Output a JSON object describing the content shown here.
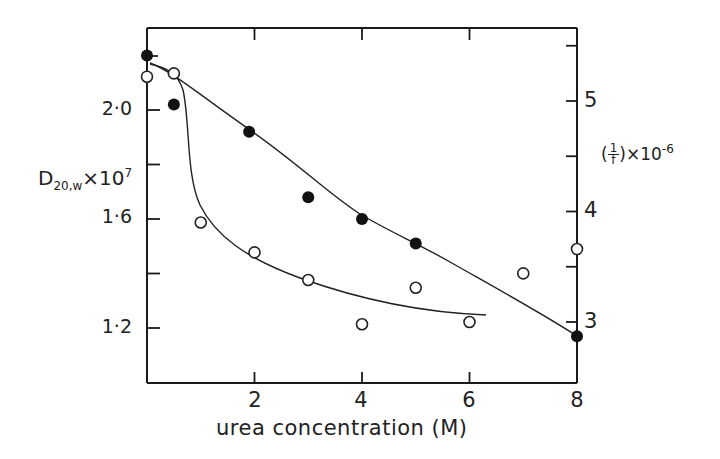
{
  "chart_data": {
    "type": "scatter",
    "title": "",
    "xlabel": "urea concentration (M)",
    "ylabel_left": "D20,w ×10^7",
    "ylabel_right": "(1/f) ×10^-6",
    "xlim": [
      0,
      8
    ],
    "ylim_left": [
      1.0,
      2.3
    ],
    "ylim_right": [
      2.45,
      5.65
    ],
    "x_ticks": [
      2,
      4,
      6,
      8
    ],
    "y_ticks_left_labeled": [
      1.2,
      1.6,
      2.0
    ],
    "y_ticks_left_minor": [
      1.4,
      1.8
    ],
    "y_ticks_right_labeled": [
      3,
      4,
      5
    ],
    "y_ticks_right_minor": [
      3.5,
      4.5,
      5.5
    ],
    "grid": false,
    "legend": null,
    "series": [
      {
        "name": "D20,w x 10^7 (filled circles, left axis)",
        "marker": "filled-circle",
        "axis": "left",
        "x": [
          0,
          0.5,
          1.9,
          3,
          4,
          5,
          8
        ],
        "y": [
          2.2,
          2.02,
          1.92,
          1.68,
          1.6,
          1.51,
          1.17
        ]
      },
      {
        "name": "(1/f) x 10^-6 (open circles, right axis)",
        "marker": "open-circle",
        "axis": "right",
        "x": [
          0,
          0.5,
          1,
          2,
          3,
          4,
          5,
          6,
          7,
          8
        ],
        "y": [
          5.22,
          5.25,
          3.9,
          3.63,
          3.38,
          2.98,
          3.31,
          3.0,
          3.44,
          3.66
        ]
      }
    ],
    "curves": [
      {
        "name": "fit through filled circles",
        "axis": "left",
        "description": "near-linear decline from ~2.15 at 0 M to ~1.17 at 8 M"
      },
      {
        "name": "fit through open circles",
        "axis": "right",
        "description": "sigmoidal drop between 0.5 and 1.5 M then flattening to ~3.0 at 6.2 M"
      }
    ]
  },
  "labels": {
    "x_ticks": [
      "2",
      "4",
      "6",
      "8"
    ],
    "left_ticks": [
      "2·0",
      "1·6",
      "1·2"
    ],
    "right_ticks": [
      "5",
      "4",
      "3"
    ],
    "xlabel": "urea concentration (M)",
    "ylabel_left_main": "D",
    "ylabel_left_sub": "20,w",
    "ylabel_left_times": "×10",
    "ylabel_left_exp": "7",
    "ylabel_right_open": "(",
    "ylabel_right_num": "1",
    "ylabel_right_den": "f",
    "ylabel_right_close": ")",
    "ylabel_right_times": "×10",
    "ylabel_right_exp": "-6"
  },
  "colors": {
    "ink": "#1a1a1a",
    "background": "#ffffff"
  }
}
